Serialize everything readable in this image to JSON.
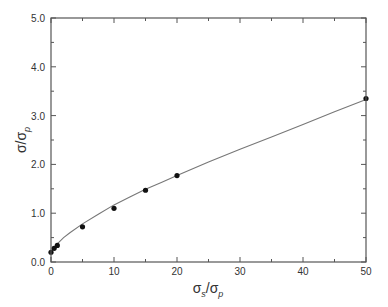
{
  "chart_data": {
    "type": "scatter",
    "title": "",
    "xlabel": "σs/σp",
    "xlabel_main": "σ",
    "xlabel_sub": "s",
    "xlabel_sep": "/σ",
    "xlabel_sub2": "p",
    "ylabel": "σ/σp",
    "ylabel_main": "σ/σ",
    "ylabel_sub": "p",
    "xlim": [
      0,
      50
    ],
    "ylim": [
      0,
      5.0
    ],
    "x_ticks": [
      0,
      10,
      20,
      30,
      40,
      50
    ],
    "x_tick_labels": [
      "0",
      "10",
      "20",
      "30",
      "40",
      "50"
    ],
    "x_minor_ticks": [
      5,
      15,
      25,
      35,
      45
    ],
    "y_ticks": [
      0,
      1,
      2,
      3,
      4,
      5
    ],
    "y_tick_labels": [
      "0.0",
      "1.0",
      "2.0",
      "3.0",
      "4.0",
      "5.0"
    ],
    "y_minor_ticks": [
      0.5,
      1.5,
      2.5,
      3.5,
      4.5
    ],
    "grid": false,
    "legend": null,
    "series": [
      {
        "name": "measured",
        "kind": "points",
        "x": [
          0,
          0.5,
          1,
          5,
          10,
          15,
          20,
          50
        ],
        "y": [
          0.2,
          0.28,
          0.34,
          0.72,
          1.1,
          1.47,
          1.77,
          3.35
        ]
      },
      {
        "name": "fit",
        "kind": "line",
        "x": [
          0,
          0.5,
          1,
          2,
          3,
          5,
          7.5,
          10,
          12.5,
          15,
          17.5,
          20,
          25,
          30,
          35,
          40,
          45,
          50
        ],
        "y": [
          0.2,
          0.29,
          0.37,
          0.5,
          0.6,
          0.78,
          0.98,
          1.17,
          1.33,
          1.49,
          1.63,
          1.77,
          2.05,
          2.31,
          2.56,
          2.82,
          3.08,
          3.33
        ]
      }
    ],
    "colors": {
      "axis": "#555555",
      "points": "#111111",
      "line": "#777777"
    }
  }
}
